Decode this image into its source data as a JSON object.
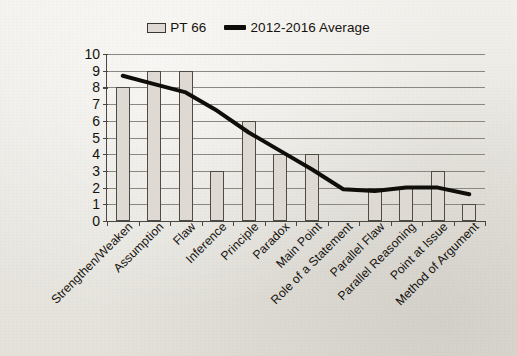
{
  "legend": {
    "items": [
      {
        "label": "PT 66",
        "marker": "bar-swatch-icon",
        "color": "#dedad3"
      },
      {
        "label": "2012-2016 Average",
        "marker": "line-swatch-icon",
        "color": "#100e0b"
      }
    ]
  },
  "axis": {
    "y_ticks": [
      "10",
      "9",
      "8",
      "7",
      "6",
      "5",
      "4",
      "3",
      "2",
      "1",
      "0"
    ]
  },
  "chart_data": {
    "type": "bar",
    "title": "",
    "subtitle": "",
    "xlabel": "",
    "ylabel": "",
    "ylim": [
      0,
      10
    ],
    "ytick_step": 1,
    "grid": true,
    "legend_position": "top-center",
    "categories": [
      "Strengthen/Weaken",
      "Assumption",
      "Flaw",
      "Inference",
      "Principle",
      "Paradox",
      "Main Point",
      "Role of a Statement",
      "Parallel Flaw",
      "Parallel Reasoning",
      "Point at Issue",
      "Method of Argument"
    ],
    "series": [
      {
        "name": "PT 66",
        "type": "bar",
        "color": "#dedad3",
        "edgecolor": "#4e4b45",
        "values": [
          8,
          9,
          9,
          3,
          6,
          4,
          4,
          0,
          2,
          2,
          3,
          1
        ]
      },
      {
        "name": "2012-2016 Average",
        "type": "line",
        "color": "#100e0b",
        "linewidth": 4,
        "values": [
          8.7,
          8.2,
          7.7,
          6.6,
          5.3,
          4.2,
          3.1,
          1.9,
          1.8,
          2.0,
          2.0,
          1.6
        ]
      }
    ]
  }
}
